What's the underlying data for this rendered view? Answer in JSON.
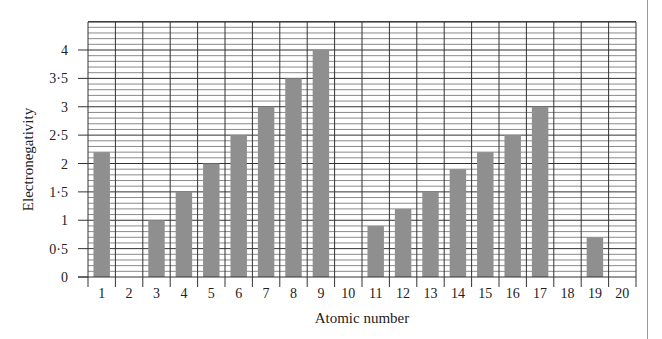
{
  "chart_data": {
    "type": "bar",
    "title": "",
    "xlabel": "Atomic number",
    "ylabel": "Electronegativity",
    "categories": [
      "1",
      "2",
      "3",
      "4",
      "5",
      "6",
      "7",
      "8",
      "9",
      "10",
      "11",
      "12",
      "13",
      "14",
      "15",
      "16",
      "17",
      "18",
      "19",
      "20"
    ],
    "values": [
      2.2,
      0,
      1.0,
      1.5,
      2.0,
      2.5,
      3.0,
      3.5,
      4.0,
      0,
      0.9,
      1.2,
      1.5,
      1.9,
      2.2,
      2.5,
      3.0,
      0,
      0.7,
      0
    ],
    "ylim": [
      0,
      4.5
    ],
    "yticks": [
      0,
      0.5,
      1,
      1.5,
      2,
      2.5,
      3,
      3.5,
      4
    ],
    "ytick_labels": [
      "0",
      "0·5",
      "1",
      "1·5",
      "2",
      "2·5",
      "3",
      "3·5",
      "4"
    ],
    "minor_grid_step": 0.1,
    "grid": true,
    "legend": null,
    "bar_color": "#8f8f8f",
    "grid_color": "#222222"
  }
}
